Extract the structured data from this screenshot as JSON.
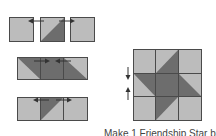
{
  "caption": "Make 1 Friendship Star block",
  "colors": {
    "light": "#bcbcbc",
    "dark": "#6d6d6d",
    "border": "#4a4a4a",
    "arrow": "#333333"
  },
  "rows": [
    {
      "id": "row-1",
      "squares": [
        "light",
        "hst-light-ul-dark-lr",
        "light"
      ],
      "arrows": [
        "left",
        "right"
      ]
    },
    {
      "id": "row-2",
      "squares": [
        "hst-light-ll-dark-ur",
        "dark",
        "hst-dark-ll-light-ur"
      ],
      "arrows": [
        "right",
        "left"
      ]
    },
    {
      "id": "row-3",
      "squares": [
        "light",
        "hst-dark-ul-light-lr",
        "light"
      ],
      "arrows": [
        "left",
        "right"
      ]
    }
  ],
  "block": {
    "grid": [
      [
        "light",
        "hst-light-ul-dark-lr",
        "light"
      ],
      [
        "hst-light-ll-dark-ur",
        "dark",
        "hst-dark-ll-light-ur"
      ],
      [
        "light",
        "hst-dark-ul-light-lr",
        "light"
      ]
    ],
    "side_arrows": [
      "down",
      "up"
    ]
  }
}
